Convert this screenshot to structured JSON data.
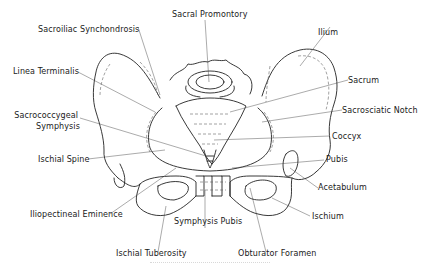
{
  "figure": {
    "colors": {
      "line": "#222222",
      "leader": "#444444",
      "text": "#1a1a1a",
      "background": "#ffffff"
    }
  },
  "labels": {
    "sacral_promontory": "Sacral Promontory",
    "sacroiliac_synchondrosis": "Sacroiliac Synchondrosis",
    "ilium": "Ilium",
    "linea_terminalis": "Linea Terminalis",
    "sacrum": "Sacrum",
    "sacrococcygeal_symphysis_1": "Sacrococcygeal",
    "sacrococcygeal_symphysis_2": "Symphysis",
    "sacrosciatic_notch": "Sacrosciatic Notch",
    "coccyx": "Coccyx",
    "ischial_spine": "Ischial Spine",
    "pubis": "Pubis",
    "acetabulum": "Acetabulum",
    "iliopectineal_eminence": "Iliopectineal Eminence",
    "symphysis_pubis": "Symphysis Pubis",
    "ischium": "Ischium",
    "ischial_tuberosity": "Ischial Tuberosity",
    "obturator_foramen": "Obturator Foramen"
  }
}
